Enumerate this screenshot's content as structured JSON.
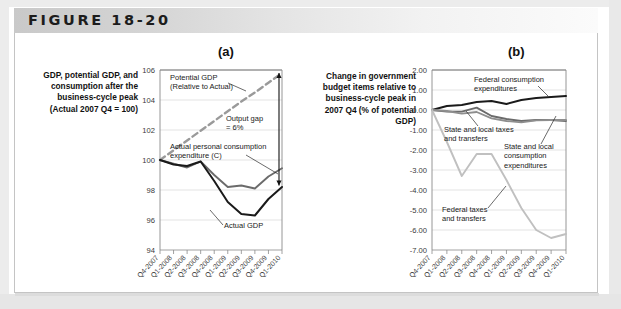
{
  "figure": {
    "title": "FIGURE 18-20",
    "panel_a_letter": "(a)",
    "panel_b_letter": "(b)",
    "panel_a_axis_label": "GDP, potential GDP, and consumption after the business-cycle peak (Actual 2007 Q4 = 100)",
    "panel_b_axis_label": "Change in government budget items relative to business-cycle peak in 2007 Q4 (% of potential GDP)"
  },
  "colors": {
    "header_start": "#c9c9c9",
    "header_end": "#fbfbfb",
    "panel_border": "#c4c4c4",
    "series_black": "#1a1a1a",
    "series_dark_gray": "#6b6b6b",
    "series_mid_gray": "#8e8e8e",
    "series_light_gray": "#c0c0c0",
    "grid": "#d8d8d8",
    "axis": "#8a8a8a"
  },
  "chart_data": [
    {
      "id": "panel-a",
      "type": "line",
      "title": "(a)",
      "ylabel": "GDP, potential GDP, and consumption after the business-cycle peak (Actual 2007 Q4 = 100)",
      "xlabel": "",
      "ylim": [
        94,
        106
      ],
      "yticks": [
        94,
        96,
        98,
        100,
        102,
        104,
        106
      ],
      "ytick_labels": [
        "94",
        "96",
        "98",
        "100",
        "102",
        "104",
        "106"
      ],
      "grid": true,
      "legend": "inline-annotations",
      "categories": [
        "Q4-2007",
        "Q1-2008",
        "Q2-2008",
        "Q3-2008",
        "Q4-2008",
        "Q1-2009",
        "Q2-2009",
        "Q3-2009",
        "Q4-2009",
        "Q1-2010"
      ],
      "series": [
        {
          "name": "Potential GDP (Relative to Actual)",
          "style": "dashed",
          "color": "#9a9a9a",
          "values": [
            100.0,
            100.65,
            101.3,
            101.95,
            102.6,
            103.25,
            103.9,
            104.5,
            105.15,
            105.8
          ]
        },
        {
          "name": "Actual personal consumption expenditure (C)",
          "style": "solid",
          "color": "#6b6b6b",
          "values": [
            100.0,
            99.75,
            99.5,
            99.9,
            99.0,
            98.2,
            98.3,
            98.1,
            98.9,
            99.45
          ]
        },
        {
          "name": "Actual GDP",
          "style": "solid",
          "color": "#1a1a1a",
          "values": [
            100.0,
            99.7,
            99.6,
            99.9,
            98.6,
            97.2,
            96.4,
            96.3,
            97.4,
            98.2
          ]
        }
      ],
      "annotations": [
        {
          "name": "potential-gdp-label",
          "text": "Potential GDP\n(Relative to Actual)"
        },
        {
          "name": "output-gap-label",
          "text": "Output gap\n= 6%"
        },
        {
          "name": "consumption-label",
          "text": "Actual personal consumption\nexpenditure (C)"
        },
        {
          "name": "actual-gdp-label",
          "text": "Actual GDP"
        }
      ]
    },
    {
      "id": "panel-b",
      "type": "line",
      "title": "(b)",
      "ylabel": "Change in government budget items relative to business-cycle peak in 2007 Q4 (% of potential GDP)",
      "xlabel": "",
      "ylim": [
        -7.0,
        2.0
      ],
      "yticks": [
        -7.0,
        -6.0,
        -5.0,
        -4.0,
        -3.0,
        -2.0,
        -1.0,
        0.0,
        1.0,
        2.0
      ],
      "ytick_labels": [
        "-7.00",
        "-6.00",
        "-5.00",
        "-4.00",
        "-3.00",
        "-2.00",
        "-1.00",
        "0.00",
        "1.00",
        "2.00"
      ],
      "grid": true,
      "legend": "inline-annotations",
      "categories": [
        "Q4-2007",
        "Q1-2008",
        "Q2-2008",
        "Q3-2008",
        "Q4-2008",
        "Q1-2009",
        "Q2-2009",
        "Q3-2009",
        "Q4-2009",
        "Q1-2010"
      ],
      "series": [
        {
          "name": "Federal consumption expenditures",
          "style": "solid",
          "color": "#1a1a1a",
          "values": [
            0.0,
            0.2,
            0.25,
            0.4,
            0.45,
            0.3,
            0.5,
            0.6,
            0.65,
            0.7
          ]
        },
        {
          "name": "State and local taxes and transfers",
          "style": "solid",
          "color": "#6b6b6b",
          "values": [
            0.0,
            -0.08,
            -0.08,
            0.12,
            -0.3,
            -0.45,
            -0.55,
            -0.5,
            -0.5,
            -0.55
          ]
        },
        {
          "name": "State and local consumption expenditures",
          "style": "solid",
          "color": "#8e8e8e",
          "values": [
            0.0,
            -0.05,
            -0.18,
            -0.1,
            -0.42,
            -0.55,
            -0.62,
            -0.52,
            -0.5,
            -0.5
          ]
        },
        {
          "name": "Federal taxes and transfers",
          "style": "solid",
          "color": "#c0c0c0",
          "values": [
            0.0,
            -1.6,
            -3.3,
            -2.2,
            -2.2,
            -3.5,
            -4.9,
            -6.0,
            -6.4,
            -6.2
          ]
        }
      ],
      "annotations": [
        {
          "name": "federal-consumption-label",
          "text": "Federal consumption\nexpenditures"
        },
        {
          "name": "state-local-taxes-label",
          "text": "State and local taxes\nand transfers"
        },
        {
          "name": "state-local-consumption-label",
          "text": "State and local\nconsumption\nexpenditures"
        },
        {
          "name": "federal-taxes-label",
          "text": "Federal taxes\nand transfers"
        }
      ]
    }
  ]
}
